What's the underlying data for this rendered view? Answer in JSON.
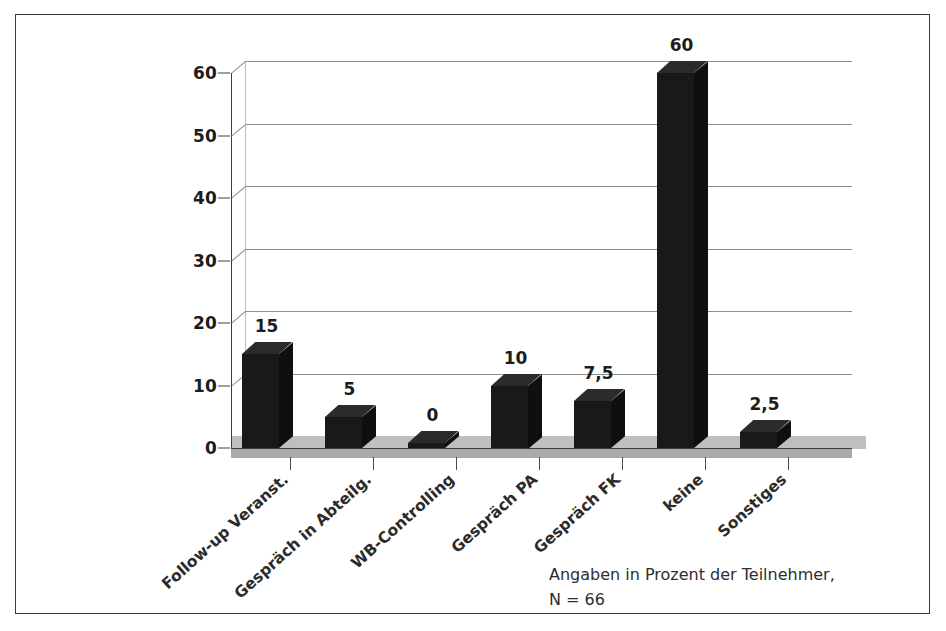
{
  "chart_data": {
    "type": "bar",
    "title": "",
    "xlabel": "",
    "ylabel": "",
    "categories": [
      "Follow-up Veranst.",
      "Gespräch in Abteilg.",
      "WB-Controlling",
      "Gespräch PA",
      "Gespräch FK",
      "keine",
      "Sonstiges"
    ],
    "values": [
      15,
      5,
      0,
      10,
      7.5,
      60,
      2.5
    ],
    "value_labels": [
      "15",
      "5",
      "0",
      "10",
      "7,5",
      "60",
      "2,5"
    ],
    "ylim": [
      0,
      60
    ],
    "yticks": [
      0,
      10,
      20,
      30,
      40,
      50,
      60
    ],
    "ytick_labels": [
      "0",
      "10",
      "20",
      "30",
      "40",
      "50",
      "60"
    ],
    "grid": true,
    "legend": false,
    "style": "3d-column",
    "bar_color": "#191919",
    "floor_color": "#a9a9a9",
    "grid_color": "#8d8d8d",
    "axis_color": "#3f3f3f",
    "note_lines": [
      "Angaben in Prozent der Teilnehmer,",
      "N = 66"
    ]
  }
}
